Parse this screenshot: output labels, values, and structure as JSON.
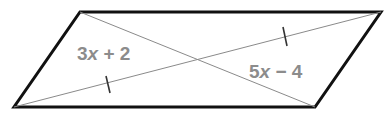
{
  "figure": {
    "shape": "parallelogram",
    "vertices": {
      "top_left": [
        80,
        12
      ],
      "top_right": [
        381,
        12
      ],
      "bottom_right": [
        315,
        107
      ],
      "bottom_left": [
        14,
        107
      ]
    },
    "diagonals": [
      "top_left-bottom_right",
      "bottom_left-top_right"
    ],
    "labels": [
      {
        "coef": "3",
        "var": "x",
        "op": " + ",
        "const": "2"
      },
      {
        "coef": "5",
        "var": "x",
        "op": " − ",
        "const": "4"
      }
    ],
    "tick_marks": 2,
    "colors": {
      "outline": "#111111",
      "diagonal": "#8a8a8a",
      "label": "#8c8c8c",
      "tick": "#333333"
    }
  }
}
